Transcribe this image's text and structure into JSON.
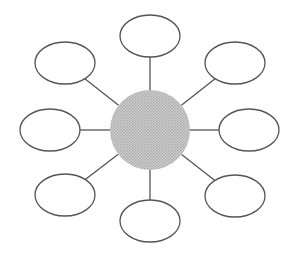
{
  "diagram": {
    "type": "bubble-map",
    "width": 293,
    "height": 255,
    "stroke_color": "#555555",
    "center_fill": "#c4c4c4",
    "center_dot_color": "#a8a8a8",
    "node_fill": "#ffffff",
    "center": {
      "cx": 150,
      "cy": 130,
      "r": 40,
      "label": ""
    },
    "nodes": [
      {
        "id": "top",
        "cx": 150,
        "cy": 36,
        "rx": 30,
        "ry": 21,
        "label": ""
      },
      {
        "id": "upper-right",
        "cx": 235,
        "cy": 63,
        "rx": 30,
        "ry": 21,
        "label": ""
      },
      {
        "id": "right",
        "cx": 249,
        "cy": 130,
        "rx": 30,
        "ry": 21,
        "label": ""
      },
      {
        "id": "lower-right",
        "cx": 235,
        "cy": 196,
        "rx": 30,
        "ry": 21,
        "label": ""
      },
      {
        "id": "bottom",
        "cx": 150,
        "cy": 221,
        "rx": 30,
        "ry": 21,
        "label": ""
      },
      {
        "id": "lower-left",
        "cx": 65,
        "cy": 195,
        "rx": 30,
        "ry": 21,
        "label": ""
      },
      {
        "id": "left",
        "cx": 50,
        "cy": 130,
        "rx": 30,
        "ry": 21,
        "label": ""
      },
      {
        "id": "upper-left",
        "cx": 65,
        "cy": 63,
        "rx": 30,
        "ry": 21,
        "label": ""
      }
    ]
  }
}
